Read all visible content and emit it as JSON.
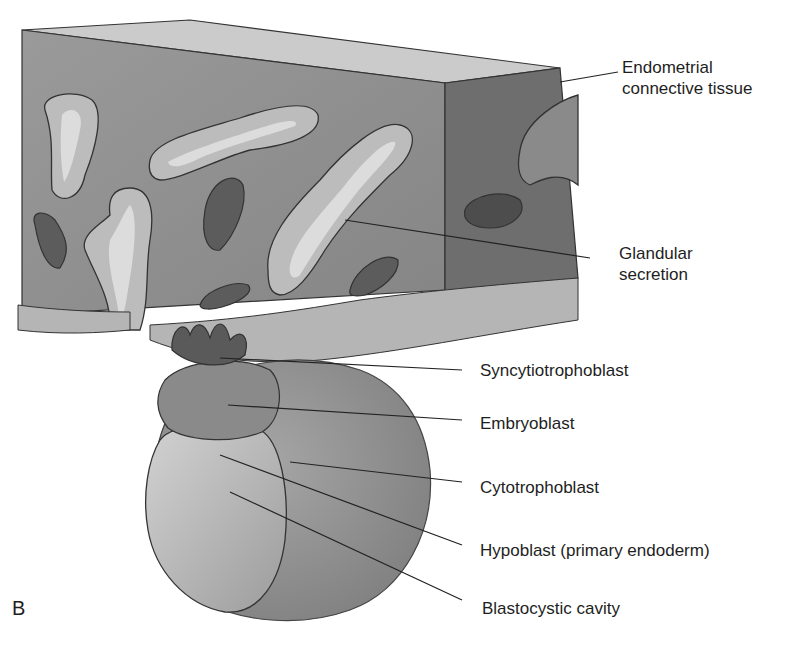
{
  "figure": {
    "panel_letter": "B",
    "colors": {
      "tissue_front": "#8f8f8f",
      "tissue_side": "#6c6c6c",
      "tissue_top": "#c8c8c8",
      "gland_cells": "#b9b9b9",
      "secretion": "#d9d9d9",
      "vessel": "#5e5e5e",
      "blastocyst_outer": "#9a9a9a",
      "cavity": "#c2c2c2",
      "embryoblast": "#8a8a8a",
      "line": "#222222"
    }
  },
  "labels": [
    {
      "id": "endometrial",
      "lines": [
        "Endometrial",
        "connective tissue"
      ]
    },
    {
      "id": "glandular",
      "lines": [
        "Glandular",
        "secretion"
      ]
    },
    {
      "id": "syncytiotrophoblast",
      "lines": [
        "Syncytiotrophoblast"
      ]
    },
    {
      "id": "embryoblast",
      "lines": [
        "Embryoblast"
      ]
    },
    {
      "id": "cytotrophoblast",
      "lines": [
        "Cytotrophoblast"
      ]
    },
    {
      "id": "hypoblast",
      "lines": [
        "Hypoblast (primary endoderm)"
      ]
    },
    {
      "id": "blastocystic",
      "lines": [
        "Blastocystic cavity"
      ]
    }
  ]
}
